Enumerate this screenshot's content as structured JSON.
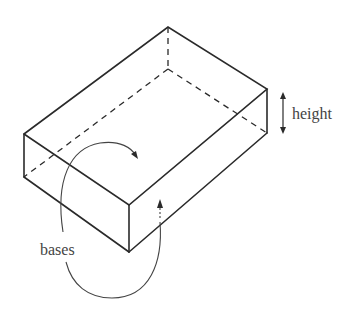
{
  "diagram": {
    "type": "rectangular prism",
    "labels": {
      "height": "height",
      "bases": "bases"
    },
    "colors": {
      "line": "#2a2a2a",
      "text": "#444444",
      "background": "#ffffff"
    }
  }
}
